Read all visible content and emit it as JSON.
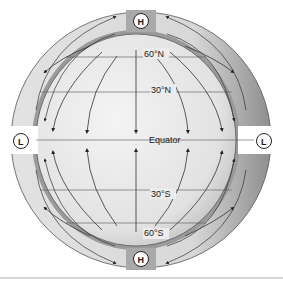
{
  "diagram": {
    "latitude_labels": {
      "n60": "60°N",
      "n30": "30°N",
      "equator": "Equator",
      "s30": "30°S",
      "s60": "60°S"
    },
    "pressure_centers": {
      "north_pole": "H",
      "south_pole": "H",
      "equator_left": "L",
      "equator_right": "L"
    },
    "legend": {
      "H": "High pressure",
      "L": "Low pressure"
    },
    "colors": {
      "globe_fill": "#e6e6e6",
      "ring_fill": "#d6d6d6",
      "ring_shadow": "#9a9a9a",
      "line": "#333333",
      "background": "#ffffff"
    }
  }
}
